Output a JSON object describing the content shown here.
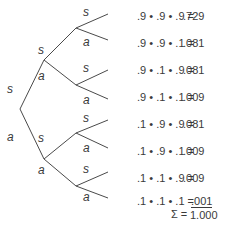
{
  "tree": {
    "root_labels": {
      "upper": "s",
      "lower": "a"
    },
    "level1": [
      {
        "upper": "s",
        "lower": "a"
      },
      {
        "upper": "s",
        "lower": "a"
      }
    ],
    "level2": [
      {
        "upper": "s",
        "lower": "a"
      },
      {
        "upper": "s",
        "lower": "a"
      },
      {
        "upper": "s",
        "lower": "a"
      },
      {
        "upper": "s",
        "lower": "a"
      }
    ]
  },
  "rows": [
    {
      "expr": ".9 • .9 • .9 =",
      "result": ".729"
    },
    {
      "expr": ".9 • .9 • .1 =",
      "result": ".081"
    },
    {
      "expr": ".9 • .1 • .9 =",
      "result": ".081"
    },
    {
      "expr": ".9 • .1 • .1 =",
      "result": ".009"
    },
    {
      "expr": ".1 • .9 • .9 =",
      "result": ".081"
    },
    {
      "expr": ".1 • .9 • .1 =",
      "result": ".009"
    },
    {
      "expr": ".1 • .1 • .9 =",
      "result": ".009"
    },
    {
      "expr": ".1 • .1 • .1 =",
      "result": ".001"
    }
  ],
  "sum": {
    "label": "Σ =",
    "value": "1.000"
  }
}
